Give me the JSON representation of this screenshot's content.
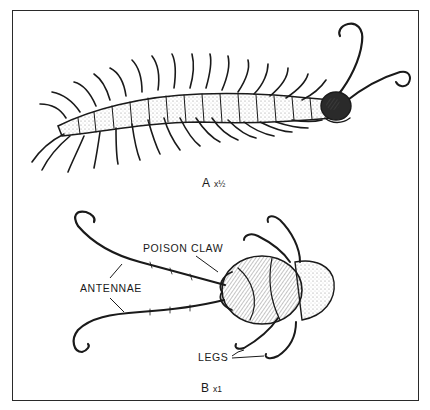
{
  "figure": {
    "panels": [
      {
        "id": "A",
        "letter": "A",
        "scale": "x½",
        "description": "whole centipede, dorsal view"
      },
      {
        "id": "B",
        "letter": "B",
        "scale": "x1",
        "description": "head region, ventral view"
      }
    ],
    "labels": {
      "poison_claw": "POISON CLAW",
      "antennae": "ANTENNAE",
      "legs": "LEGS"
    },
    "colors": {
      "ink": "#1a1a1a",
      "paper": "#ffffff",
      "shade": "#6a6a6a"
    }
  }
}
